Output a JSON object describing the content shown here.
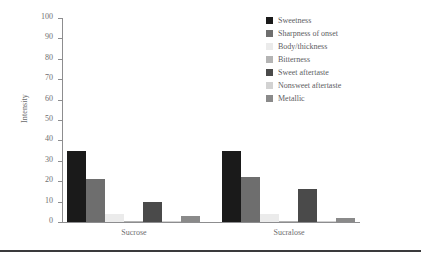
{
  "chart_data": {
    "type": "bar",
    "title": "",
    "xlabel": "",
    "ylabel": "Intensity",
    "ylim": [
      0,
      100
    ],
    "yticks": [
      0,
      10,
      20,
      30,
      40,
      50,
      60,
      70,
      80,
      90,
      100
    ],
    "grid": false,
    "legend_position": "top-right",
    "categories": [
      "Sucrose",
      "Sucralose"
    ],
    "series": [
      {
        "name": "Sweetness",
        "color": "#1a1a1a",
        "values": [
          35,
          35
        ]
      },
      {
        "name": "Sharpness of onset",
        "color": "#6e6e6e",
        "values": [
          21,
          22
        ]
      },
      {
        "name": "Body/thickness",
        "color": "#ebebeb",
        "values": [
          4,
          4
        ]
      },
      {
        "name": "Bitterness",
        "color": "#b4b4b4",
        "values": [
          0.5,
          0.5
        ]
      },
      {
        "name": "Sweet aftertaste",
        "color": "#4a4a4a",
        "values": [
          10,
          16
        ]
      },
      {
        "name": "Nonsweet aftertaste",
        "color": "#d2d2d2",
        "values": [
          0.5,
          0.5
        ]
      },
      {
        "name": "Metallic",
        "color": "#8a8a8a",
        "values": [
          3,
          2
        ]
      }
    ]
  },
  "axis": {
    "y_title": "Intensity",
    "y_tick_labels": [
      "0",
      "10",
      "20",
      "30",
      "40",
      "50",
      "60",
      "70",
      "80",
      "90",
      "100"
    ],
    "x_tick_labels": [
      "Sucrose",
      "Sucralose"
    ]
  },
  "legend": {
    "items": [
      {
        "label": "Sweetness"
      },
      {
        "label": "Sharpness of onset"
      },
      {
        "label": "Body/thickness"
      },
      {
        "label": "Bitterness"
      },
      {
        "label": "Sweet aftertaste"
      },
      {
        "label": "Nonsweet aftertaste"
      },
      {
        "label": "Metallic"
      }
    ]
  },
  "style": {
    "axis_color": "#8d8d8f",
    "text_color": "#6e6e70",
    "rule_color": "#3a3a3c",
    "background": "#ffffff"
  }
}
